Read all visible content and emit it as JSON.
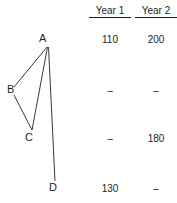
{
  "diagram": {
    "nodes": [
      {
        "id": "A",
        "label": "A",
        "x": 47,
        "y": 47
      },
      {
        "id": "B",
        "label": "B",
        "x": 14,
        "y": 88
      },
      {
        "id": "C",
        "label": "C",
        "x": 32,
        "y": 130
      },
      {
        "id": "D",
        "label": "D",
        "x": 55,
        "y": 182
      }
    ],
    "edges": [
      {
        "from": "A",
        "to": "B"
      },
      {
        "from": "A",
        "to": "C"
      },
      {
        "from": "B",
        "to": "C"
      },
      {
        "from": "A",
        "to": "D"
      }
    ],
    "line_color": "#3a3a3a"
  },
  "table": {
    "columns": [
      {
        "label": "Year 1"
      },
      {
        "label": "Year 2"
      }
    ],
    "rows": [
      {
        "node": "A",
        "year1": "110",
        "year2": "200"
      },
      {
        "node": "B",
        "year1": "–",
        "year2": "–"
      },
      {
        "node": "C",
        "year1": "–",
        "year2": "180"
      },
      {
        "node": "D",
        "year1": "130",
        "year2": "–"
      }
    ]
  }
}
